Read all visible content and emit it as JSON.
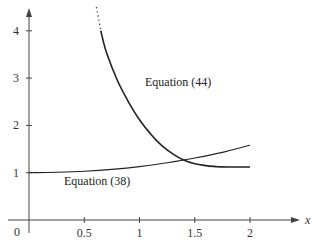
{
  "chart_data": {
    "type": "line",
    "title": "",
    "xlabel": "x",
    "ylabel": "",
    "xlim": [
      0,
      2.3
    ],
    "ylim": [
      0,
      4.4
    ],
    "grid": false,
    "legend": "none (inline curve labels)",
    "x_ticks": [
      "0.5",
      "1",
      "1.5",
      "2"
    ],
    "y_ticks": [
      "1",
      "2",
      "3",
      "4"
    ],
    "origin_label": "0",
    "series": [
      {
        "name": "Equation (44)",
        "x": [
          0.65,
          0.7,
          0.8,
          0.9,
          1.0,
          1.1,
          1.2,
          1.3,
          1.4,
          1.5,
          1.6,
          1.7,
          1.8,
          1.9,
          2.0
        ],
        "y": [
          4.0,
          3.55,
          2.95,
          2.5,
          2.12,
          1.82,
          1.58,
          1.4,
          1.27,
          1.19,
          1.15,
          1.13,
          1.12,
          1.12,
          1.12
        ],
        "dotted_extension": {
          "x": [
            0.61,
            0.65
          ],
          "y": [
            4.5,
            4.0
          ]
        }
      },
      {
        "name": "Equation (38)",
        "x": [
          0,
          0.25,
          0.5,
          0.75,
          1.0,
          1.25,
          1.5,
          1.75,
          2.0
        ],
        "y": [
          1.0,
          1.01,
          1.03,
          1.07,
          1.13,
          1.21,
          1.31,
          1.43,
          1.58
        ]
      }
    ],
    "annotations": [
      {
        "text": "Equation (44)",
        "x": 1.05,
        "y": 2.95
      },
      {
        "text": "Equation (38)",
        "x": 0.55,
        "y": 0.87
      }
    ]
  }
}
